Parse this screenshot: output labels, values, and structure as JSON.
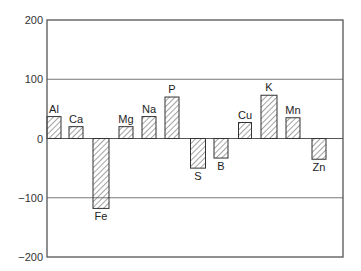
{
  "chart_data": {
    "type": "bar",
    "title": "",
    "xlabel": "",
    "ylabel": "",
    "ylim": [
      -200,
      200
    ],
    "yticks": [
      -200,
      -100,
      0,
      100,
      200
    ],
    "ytick_labels": [
      "−200",
      "−100",
      "0",
      "100",
      "200"
    ],
    "grid": "horizontal at 100, 0, -100",
    "legend": null,
    "bar_fill": "diagonal hatch",
    "categories": [
      "Al",
      "Ca",
      "Fe",
      "Mg",
      "Na",
      "P",
      "S",
      "B",
      "Cu",
      "K",
      "Mn",
      "Zn"
    ],
    "values": [
      37,
      20,
      -118,
      20,
      37,
      70,
      -50,
      -33,
      27,
      73,
      35,
      -35
    ]
  },
  "colors": {
    "axis": "#555555",
    "grid": "#777777",
    "bar_stroke": "#333333",
    "hatch": "#555555"
  }
}
